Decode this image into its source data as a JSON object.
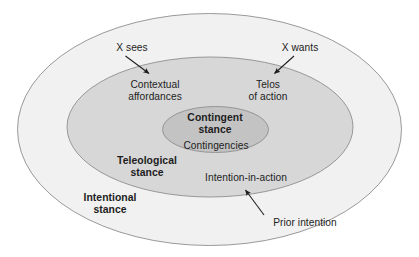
{
  "diagram": {
    "colors": {
      "outer_fill": "#f1f1f1",
      "middle_fill": "#d7d7d7",
      "inner_fill": "#c3c3c3",
      "stroke": "#8e8e8e",
      "text": "#1d1d1d",
      "background": "#ffffff"
    },
    "rings": [
      {
        "id": "outer",
        "label": "Intentional\nstance",
        "label_line1": "Intentional",
        "label_line2": "stance",
        "style": "bold",
        "fill": "#f1f1f1"
      },
      {
        "id": "middle",
        "label": "Teleological\nstance",
        "label_line1": "Teleological",
        "label_line2": "stance",
        "style": "bold",
        "fill": "#d7d7d7"
      },
      {
        "id": "inner",
        "label": "Contingent\nstance",
        "label_line1": "Contingent",
        "label_line2": "stance",
        "style": "bold",
        "fill": "#c3c3c3"
      }
    ],
    "contents": [
      {
        "id": "contextual-affordances",
        "line1": "Contextual",
        "line2": "affordances",
        "ring": "middle"
      },
      {
        "id": "telos-of-action",
        "line1": "Telos",
        "line2": "of action",
        "ring": "middle"
      },
      {
        "id": "contingencies",
        "line1": "Contingencies",
        "ring": "inner"
      },
      {
        "id": "intention-in-action",
        "line1": "Intention-in-action",
        "ring": "middle"
      }
    ],
    "annotations": [
      {
        "id": "x-sees",
        "text": "X sees",
        "points_to": "contextual-affordances",
        "arrow_direction": "down-right"
      },
      {
        "id": "x-wants",
        "text": "X wants",
        "points_to": "telos-of-action",
        "arrow_direction": "down-left"
      },
      {
        "id": "prior-intention",
        "text": "Prior intention",
        "points_to": "intention-in-action",
        "arrow_direction": "up-left"
      }
    ]
  }
}
